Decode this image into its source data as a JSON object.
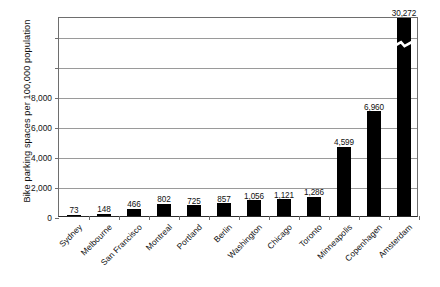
{
  "chart_data": {
    "type": "bar",
    "title": "",
    "xlabel": "",
    "ylabel": "Bike parking spaces per 100,000 population",
    "categories": [
      "Sydney",
      "Melbourne",
      "San Francisco",
      "Montreal",
      "Portland",
      "Berlin",
      "Washington",
      "Chicago",
      "Toronto",
      "Minneapolis",
      "Copenhagen",
      "Amsterdam"
    ],
    "values": [
      73,
      148,
      466,
      802,
      725,
      857,
      1056,
      1121,
      1286,
      4599,
      6960,
      30272
    ],
    "value_labels": [
      "73",
      "148",
      "466",
      "802",
      "725",
      "857",
      "1,056",
      "1,121",
      "1,286",
      "4,599",
      "6,960",
      "30,272"
    ],
    "ytick_labels": [
      "0",
      "2,000",
      "4,000",
      "6,000",
      "8,000"
    ],
    "ytick_values": [
      0,
      2000,
      4000,
      6000,
      8000
    ],
    "ylim": [
      0,
      13300
    ],
    "grid": true,
    "gridlines_unlabeled": 2,
    "legend": "none",
    "axis_break": {
      "present": true,
      "series_index": 11,
      "category": "Amsterdam",
      "note": "broken-bar zigzag mark"
    },
    "colors": {
      "bar": "#000000",
      "gridline": "#9a9a9a",
      "frame": "#6e6e6e",
      "baseline": "#2a2a2a",
      "background": "#ffffff",
      "text": "#111111"
    }
  }
}
